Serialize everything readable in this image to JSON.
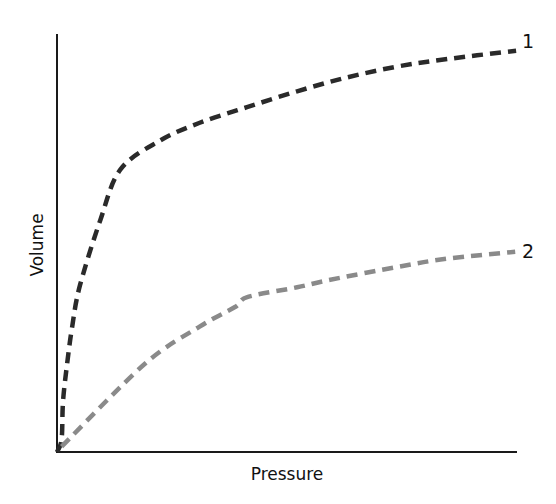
{
  "chart_data": {
    "type": "line",
    "title": "",
    "xlabel": "Pressure",
    "ylabel": "Volume",
    "x_ticks": [],
    "y_ticks": [],
    "grid": false,
    "legend": "inline end labels",
    "xlim": [
      0,
      100
    ],
    "ylim": [
      0,
      100
    ],
    "series": [
      {
        "name": "1",
        "color": "#2a2a2a",
        "style": "dashed",
        "x": [
          0,
          1,
          1.3,
          2.2,
          3.3,
          5,
          9.4,
          13.8,
          22.4,
          30.9,
          41.3,
          52.2,
          63,
          73.9,
          84.8,
          99.8
        ],
        "y": [
          0,
          3.0,
          12.0,
          21.1,
          30.0,
          39.9,
          55.4,
          67.6,
          74.5,
          78.7,
          82.5,
          86.3,
          89.6,
          92.2,
          94.0,
          96.0
        ]
      },
      {
        "name": "2",
        "color": "#8a8a8a",
        "style": "dashed",
        "x": [
          1,
          19.1,
          31,
          38.7,
          41.5,
          52.2,
          59,
          74.1,
          85,
          99.6
        ],
        "y": [
          1.3,
          21.1,
          30.0,
          34.7,
          37.1,
          39.4,
          41.1,
          44.3,
          46.3,
          47.9
        ]
      }
    ]
  },
  "labels": {
    "xlabel": "Pressure",
    "ylabel": "Volume",
    "series1_end": "1",
    "series2_end": "2"
  }
}
